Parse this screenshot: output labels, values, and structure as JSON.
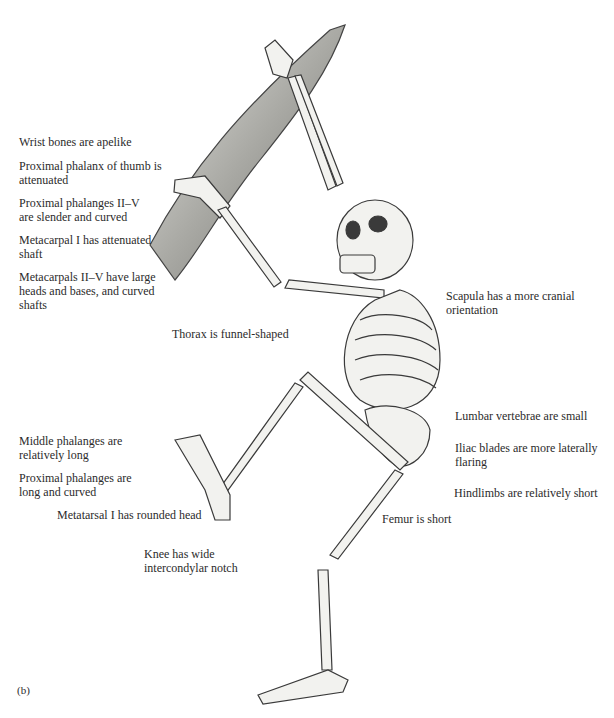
{
  "figure": {
    "panel_label": "(b)"
  },
  "labels": {
    "left": [
      {
        "text": "Wrist bones are apelike"
      },
      {
        "text": "Proximal phalanx of thumb is attenuated"
      },
      {
        "text": "Proximal phalanges II–V are slender and curved"
      },
      {
        "text": "Metacarpal I has attenuated shaft"
      },
      {
        "text": "Metacarpals II–V have large heads and bases, and curved shafts"
      }
    ],
    "center": [
      {
        "text": "Thorax is funnel-shaped"
      }
    ],
    "right": [
      {
        "text": "Scapula has a more cranial orientation"
      },
      {
        "text": "Lumbar vertebrae are small"
      },
      {
        "text": "Iliac blades are more laterally flaring"
      },
      {
        "text": "Hindlimbs are relatively short"
      }
    ],
    "foot": [
      {
        "text": "Middle phalanges are relatively long"
      },
      {
        "text": "Proximal phalanges are long and curved"
      },
      {
        "text": "Metatarsal I has rounded head"
      }
    ],
    "lower": [
      {
        "text": "Femur is short"
      },
      {
        "text": "Knee has  wide intercondylar notch"
      }
    ]
  },
  "colors": {
    "bone_fill": "#f2f2ef",
    "bone_stroke": "#3a3a3a",
    "branch_fill": "#b9b9b5",
    "text": "#2b2b2b"
  }
}
